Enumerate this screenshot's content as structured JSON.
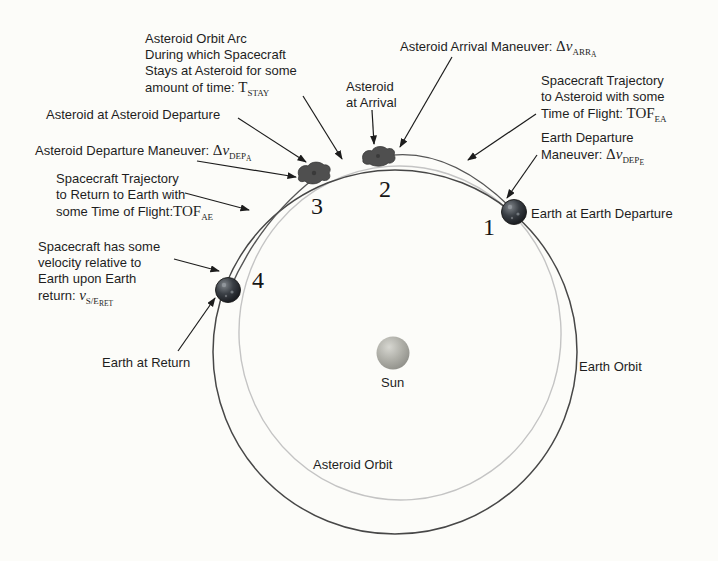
{
  "figure": {
    "background": "#fcfcf9",
    "ink": "#1e1e1e",
    "orbit_stroke": "#474747",
    "asteroid_orbit_stroke": "#c4c4c4",
    "icons": {
      "sun_icon": "gray sphere",
      "earth_icon": "dark textured globe",
      "asteroid_icon": "irregular dark blob"
    },
    "orbit_labels": {
      "sun": "Sun",
      "earth_orbit": "Earth Orbit",
      "asteroid_orbit": "Asteroid Orbit"
    },
    "points": {
      "p1": "1",
      "p2": "2",
      "p3": "3",
      "p4": "4"
    },
    "annotations": {
      "stay": {
        "l1": "Asteroid Orbit Arc",
        "l2": "During which Spacecraft",
        "l3": "Stays at Asteroid for some",
        "l4": "amount of time: ",
        "sym": "T",
        "sub": "STAY"
      },
      "arrival_obj": {
        "l1": "Asteroid",
        "l2": "at Arrival"
      },
      "arrival_mnv": {
        "text": "Asteroid Arrival Maneuver: ",
        "sym": "Δ",
        "sym2": "v",
        "sub": "ARR",
        "subsub": "A"
      },
      "tof_ea": {
        "l1": "Spacecraft Trajectory",
        "l2": "to Asteroid with some",
        "l3": "Time of Flight: ",
        "sym": "TOF",
        "sub": "EA"
      },
      "dep_e_mnv": {
        "l1": "Earth Departure",
        "l2": "Maneuver: ",
        "sym": "Δ",
        "sym2": "v",
        "sub": "DEP",
        "subsub": "E"
      },
      "earth_dep": {
        "text": "Earth at Earth Departure"
      },
      "ast_dep_obj": {
        "text": "Asteroid at Asteroid Departure"
      },
      "ast_dep_mnv": {
        "text": "Asteroid Departure Maneuver: ",
        "sym": "Δ",
        "sym2": "v",
        "sub": "DEP",
        "subsub": "A"
      },
      "tof_ae": {
        "l1": "Spacecraft Trajectory",
        "l2": "to Return to Earth with",
        "l3": "some Time of Flight:",
        "sym": "TOF",
        "sub": "AE"
      },
      "vel_ret": {
        "l1": "Spacecraft has some",
        "l2": "velocity relative to",
        "l3": "Earth upon Earth",
        "l4": "return: ",
        "sym": "v",
        "sub": "S/E",
        "subsub": "RET"
      },
      "earth_ret": {
        "text": "Earth at Return"
      }
    }
  }
}
